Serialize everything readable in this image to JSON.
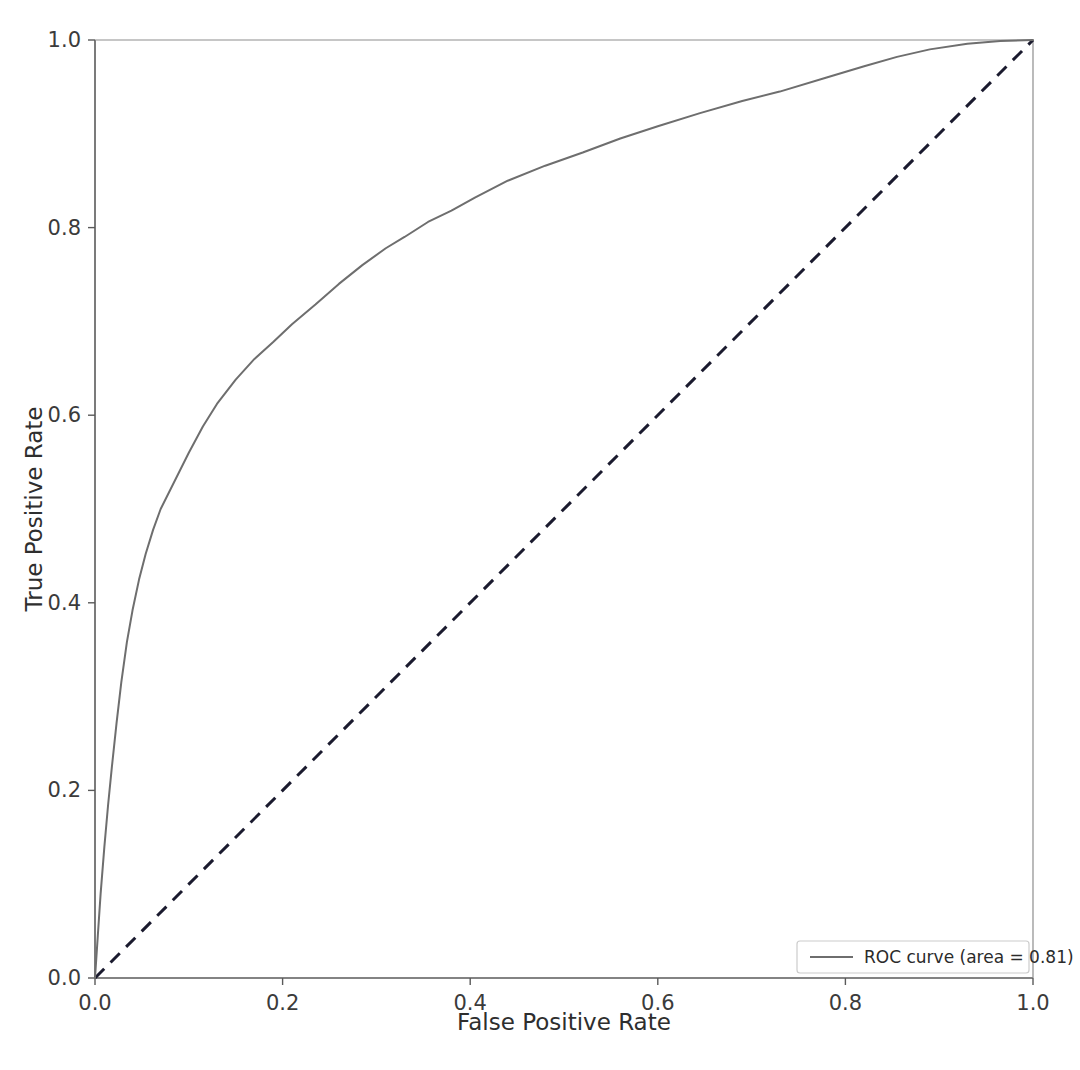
{
  "figure": {
    "width": 1080,
    "height": 1070,
    "background": "#ffffff",
    "title_fragment": ""
  },
  "chart_data": {
    "type": "line",
    "title": "",
    "xlabel": "False Positive Rate",
    "ylabel": "True Positive Rate",
    "xlim": [
      0.0,
      1.0
    ],
    "ylim": [
      0.0,
      1.0
    ],
    "xticks": [
      "0.0",
      "0.2",
      "0.4",
      "0.6",
      "0.8",
      "1.0"
    ],
    "yticks": [
      "0.0",
      "0.2",
      "0.4",
      "0.6",
      "0.8",
      "1.0"
    ],
    "xtick_values": [
      0.0,
      0.2,
      0.4,
      0.6,
      0.8,
      1.0
    ],
    "ytick_values": [
      0.0,
      0.2,
      0.4,
      0.6,
      0.8,
      1.0
    ],
    "grid": false,
    "legend_position": "lower right",
    "auc": 0.81,
    "series": [
      {
        "name": "ROC curve (area = 0.81)",
        "color": "#6e6e6e",
        "linestyle": "solid",
        "linewidth": 2,
        "x": [
          0.0,
          0.003,
          0.006,
          0.01,
          0.014,
          0.018,
          0.023,
          0.028,
          0.034,
          0.04,
          0.047,
          0.054,
          0.062,
          0.07,
          0.08,
          0.09,
          0.1,
          0.115,
          0.13,
          0.15,
          0.17,
          0.19,
          0.21,
          0.235,
          0.26,
          0.285,
          0.31,
          0.33,
          0.355,
          0.38,
          0.405,
          0.44,
          0.48,
          0.52,
          0.56,
          0.6,
          0.645,
          0.69,
          0.73,
          0.78,
          0.82,
          0.855,
          0.89,
          0.93,
          0.965,
          1.0
        ],
        "y": [
          0.0,
          0.045,
          0.09,
          0.14,
          0.185,
          0.225,
          0.272,
          0.315,
          0.358,
          0.392,
          0.425,
          0.452,
          0.478,
          0.5,
          0.52,
          0.54,
          0.56,
          0.588,
          0.612,
          0.638,
          0.66,
          0.678,
          0.697,
          0.718,
          0.74,
          0.76,
          0.778,
          0.79,
          0.806,
          0.818,
          0.832,
          0.85,
          0.866,
          0.88,
          0.895,
          0.908,
          0.922,
          0.935,
          0.945,
          0.96,
          0.972,
          0.982,
          0.99,
          0.996,
          0.999,
          1.0
        ]
      },
      {
        "name": "chance-diagonal",
        "color": "#1a1a2e",
        "linestyle": "dashed",
        "linewidth": 3,
        "x": [
          0.0,
          1.0
        ],
        "y": [
          0.0,
          1.0
        ]
      }
    ]
  },
  "legend": {
    "entries": [
      {
        "label": "ROC curve (area = 0.81)",
        "swatch_color": "#6e6e6e",
        "swatch_style": "solid"
      }
    ],
    "border_color": "#cccccc",
    "background": "#ffffff"
  },
  "axes": {
    "spine_color": "#5a5a5a",
    "tick_color": "#5a5a5a",
    "label_color": "#2e2e2e"
  }
}
